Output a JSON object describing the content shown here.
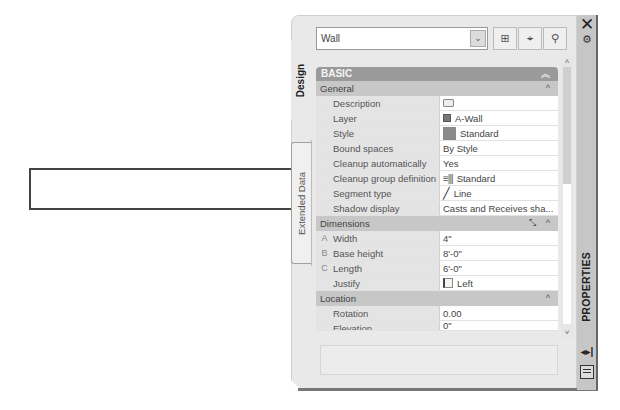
{
  "canvas": {
    "object": "wall-rectangle"
  },
  "palette": {
    "title": "PROPERTIES",
    "tabs": [
      {
        "label": "Design",
        "active": true
      },
      {
        "label": "Extended Data",
        "active": false
      }
    ],
    "object_selector": {
      "value": "Wall",
      "arrow": "⌄"
    },
    "toolbar": [
      {
        "name": "add-selection-button",
        "glyph": "⊞"
      },
      {
        "name": "quick-select-button",
        "glyph": "⌖"
      },
      {
        "name": "select-objects-button",
        "glyph": "⚲"
      }
    ],
    "sections": {
      "basic": {
        "label": "BASIC",
        "chevron": "︽",
        "general": {
          "label": "General",
          "chevron": "^",
          "rows": [
            {
              "label": "Description",
              "value": ""
            },
            {
              "label": "Layer",
              "value": "A-Wall"
            },
            {
              "label": "Style",
              "value": "Standard"
            },
            {
              "label": "Bound spaces",
              "value": "By Style"
            },
            {
              "label": "Cleanup automatically",
              "value": "Yes"
            },
            {
              "label": "Cleanup group definition",
              "value": "Standard"
            },
            {
              "label": "Segment type",
              "value": "Line"
            },
            {
              "label": "Shadow display",
              "value": "Casts and Receives sha..."
            }
          ]
        },
        "dimensions": {
          "label": "Dimensions",
          "chevron": "^",
          "rows": [
            {
              "key": "A",
              "label": "Width",
              "value": "4\""
            },
            {
              "key": "B",
              "label": "Base height",
              "value": "8'-0\""
            },
            {
              "key": "C",
              "label": "Length",
              "value": "6'-0\""
            },
            {
              "key": "",
              "label": "Justify",
              "value": "Left"
            }
          ]
        },
        "location": {
          "label": "Location",
          "chevron": "^",
          "rows": [
            {
              "label": "Rotation",
              "value": "0.00"
            },
            {
              "label": "Elevation",
              "value": "0\""
            }
          ]
        }
      }
    },
    "scroll": {
      "up": "˄",
      "down": "˅"
    },
    "title_strip": {
      "close": "✕",
      "autohide": "◂▸|"
    }
  }
}
